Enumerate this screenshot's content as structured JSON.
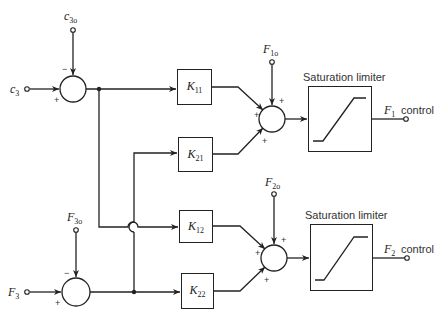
{
  "diagram": {
    "type": "block-diagram"
  },
  "inputs": {
    "top": {
      "symbol": "c",
      "sub": "3",
      "ref_symbol": "c",
      "ref_sub": "3o",
      "plus": "+",
      "minus": "−"
    },
    "bottom": {
      "symbol": "F",
      "sub": "3",
      "ref_symbol": "F",
      "ref_sub": "3o",
      "plus": "+",
      "minus": "−"
    }
  },
  "gains": [
    {
      "symbol": "K",
      "sub": "11"
    },
    {
      "symbol": "K",
      "sub": "21"
    },
    {
      "symbol": "K",
      "sub": "12"
    },
    {
      "symbol": "K",
      "sub": "22"
    }
  ],
  "summers": [
    {
      "ref_symbol": "F",
      "ref_sub": "1o",
      "signs": [
        "+",
        "+",
        "+"
      ]
    },
    {
      "ref_symbol": "F",
      "ref_sub": "2o",
      "signs": [
        "+",
        "+",
        "+"
      ]
    }
  ],
  "limiters": [
    {
      "title": "Saturation limiter"
    },
    {
      "title": "Saturation limiter"
    }
  ],
  "outputs": [
    {
      "symbol": "F",
      "sub": "1",
      "text": "control"
    },
    {
      "symbol": "F",
      "sub": "2",
      "text": "control"
    }
  ],
  "colors": {
    "line": "#222222",
    "background": "#ffffff"
  }
}
